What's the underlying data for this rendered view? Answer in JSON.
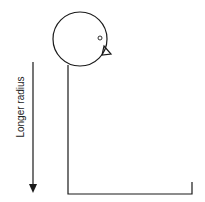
{
  "diagram": {
    "type": "pendulum-bird",
    "arrow_label": "Longer radius",
    "stroke_color": "#1a1a1a"
  }
}
